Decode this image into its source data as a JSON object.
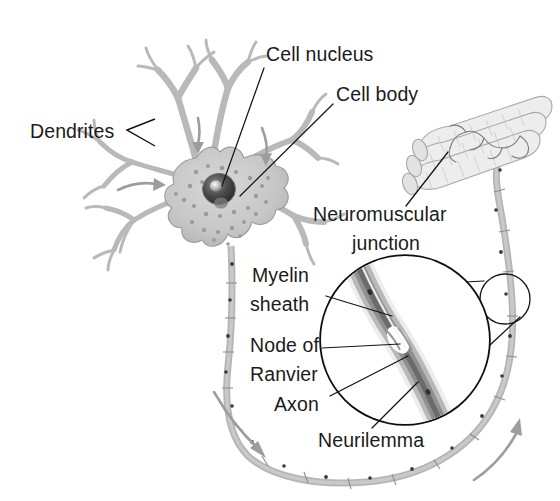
{
  "figure": {
    "background_color": "#ffffff",
    "text_color": "#1b1b1b",
    "width": 560,
    "height": 501
  },
  "labels": {
    "dendrites": "Dendrites",
    "cell_nucleus": "Cell nucleus",
    "cell_body": "Cell body",
    "neuromuscular_junction_line1": "Neuromuscular",
    "neuromuscular_junction_line2": "junction",
    "myelin_sheath_line1": "Myelin",
    "myelin_sheath_line2": "sheath",
    "node_of_ranvier_line1": "Node of",
    "node_of_ranvier_line2": "Ranvier",
    "axon": "Axon",
    "neurilemma": "Neurilemma"
  },
  "structures": {
    "soma": "cell-body",
    "nucleus": "cell-nucleus",
    "nucleolus": "nucleolus",
    "dendrite_count": 7,
    "muscle_fiber_count": 3,
    "magnified_region": "node-of-ranvier-detail"
  },
  "colors": {
    "tissue_gray": "#cfcfcf",
    "sheath_gray": "#b5b5b5",
    "outline_black": "#141414",
    "arrow_gray": "#9d9d9d",
    "nucleus_dark": "#3a3a3a"
  },
  "flow_arrows": [
    {
      "name": "dendrite-inflow-left",
      "direction": "right"
    },
    {
      "name": "dendrite-inflow-upper",
      "direction": "down"
    },
    {
      "name": "dendrite-inflow-right",
      "direction": "down"
    },
    {
      "name": "axon-conduction-descending",
      "direction": "down-right"
    },
    {
      "name": "axon-conduction-ascending",
      "direction": "up-right"
    }
  ]
}
